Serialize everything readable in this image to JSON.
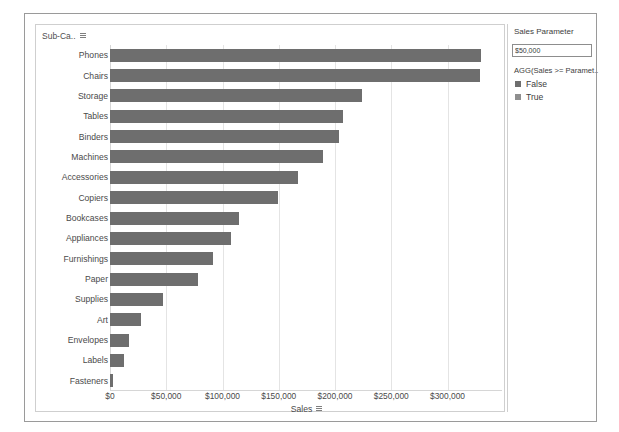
{
  "chart_data": {
    "type": "bar",
    "orientation": "horizontal",
    "title": "",
    "xlabel": "Sales",
    "ylabel": "Sub-Ca..",
    "xlim": [
      0,
      352000
    ],
    "grid": true,
    "legend_position": "right",
    "xticks": [
      "$0",
      "$50,000",
      "$100,000",
      "$150,000",
      "$200,000",
      "$250,000",
      "$300,000"
    ],
    "xtick_values": [
      0,
      50000,
      100000,
      150000,
      200000,
      250000,
      300000
    ],
    "categories": [
      "Phones",
      "Chairs",
      "Storage",
      "Tables",
      "Binders",
      "Machines",
      "Accessories",
      "Copiers",
      "Bookcases",
      "Appliances",
      "Furnishings",
      "Paper",
      "Supplies",
      "Art",
      "Envelopes",
      "Labels",
      "Fasteners"
    ],
    "values": [
      330007,
      328449,
      223844,
      206966,
      203413,
      189239,
      167380,
      149528,
      114880,
      107532,
      91705,
      78479,
      46674,
      27119,
      16476,
      12486,
      3024
    ],
    "series": [
      {
        "name": "True",
        "color": "#6e6e6e",
        "values": [
          330007,
          328449,
          223844,
          206966,
          203413,
          189239,
          167380,
          149528,
          114880,
          107532,
          91705,
          78479,
          46674,
          27119,
          16476,
          12486,
          3024
        ]
      }
    ],
    "bar_color": "#6e6e6e",
    "gridline_color": "#e4e4e4"
  },
  "chart": {
    "y_field_label": "Sub-Ca..",
    "y_field_sort_icon": "sort-descending-icon",
    "x_axis_title": "Sales",
    "x_axis_sort_icon": "sort-descending-icon"
  },
  "side_panel": {
    "parameter_title": "Sales Parameter",
    "parameter_value": "$50,000",
    "parameter_placeholder": "$50,000",
    "legend_title": "AGG(Sales >= Paramet..",
    "legend_items": [
      {
        "label": "False",
        "color": "#6e6e6e"
      },
      {
        "label": "True",
        "color": "#8f8f8f"
      }
    ]
  }
}
